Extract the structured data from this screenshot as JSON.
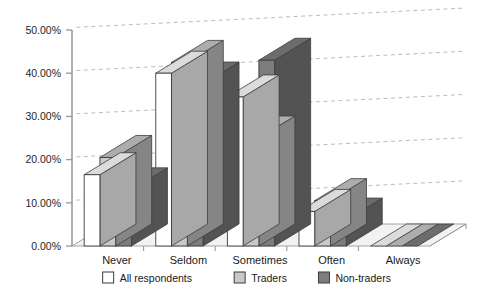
{
  "chart_data": {
    "type": "bar",
    "title": "",
    "subtitle": "",
    "xlabel": "",
    "ylabel": "",
    "categories": [
      "Never",
      "Seldom",
      "Sometimes",
      "Often",
      "Always"
    ],
    "series": [
      {
        "name": "All respondents",
        "color": "#ffffff",
        "values": [
          16.5,
          40.0,
          34.5,
          8.0,
          0.0
        ]
      },
      {
        "name": "Traders",
        "color": "#c9c9c9",
        "values": [
          20.5,
          42.5,
          25.0,
          10.5,
          0.0
        ]
      },
      {
        "name": "Non-traders",
        "color": "#7d7d7d",
        "values": [
          13.0,
          37.5,
          43.0,
          6.0,
          0.0
        ]
      }
    ],
    "ylim": [
      0,
      50
    ],
    "ytick_values": [
      0,
      10,
      20,
      30,
      40,
      50
    ],
    "ytick_labels": [
      "0.00%",
      "10.00%",
      "20.00%",
      "30.00%",
      "40.00%",
      "50.00%"
    ],
    "grid": true,
    "grid_style": "dashed",
    "legend_position": "bottom",
    "style": "3d-columns-grayscale"
  },
  "legend": {
    "items": [
      {
        "label": "All respondents",
        "swatch": "#ffffff"
      },
      {
        "label": "Traders",
        "swatch": "#c9c9c9"
      },
      {
        "label": "Non-traders",
        "swatch": "#7d7d7d"
      }
    ]
  },
  "colors": {
    "series_all_respondents": "#ffffff",
    "series_traders": "#c9c9c9",
    "series_non_traders": "#7d7d7d",
    "grid": "#b4b4b4",
    "axis": "#9a9a9a",
    "outline": "#3c3c3c",
    "text": "#202020",
    "floor": "#f2f2f2"
  }
}
